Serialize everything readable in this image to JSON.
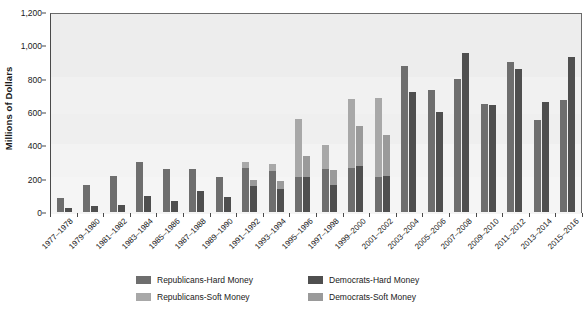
{
  "chart_data": {
    "type": "bar",
    "title": "",
    "subtitle": "",
    "xlabel": "",
    "ylabel": "Millions of Dollars",
    "ylim": [
      0,
      1200
    ],
    "ytick_values": [
      0,
      200,
      400,
      600,
      800,
      1000,
      1200
    ],
    "ytick_labels": [
      "0",
      "200",
      "400",
      "600",
      "800",
      "1,000",
      "1,200"
    ],
    "grid": false,
    "stacked": true,
    "legend_position": "below",
    "categories": [
      "1977–1978",
      "1979–1980",
      "1981–1982",
      "1983–1984",
      "1985–1986",
      "1987–1988",
      "1989–1990",
      "1991–1992",
      "1993–1994",
      "1995–1996",
      "1997–1998",
      "1999–2000",
      "2001–2002",
      "2003–2004",
      "2005–2006",
      "2007–2008",
      "2009–2010",
      "2011–2012",
      "2013–2014",
      "2015–2016"
    ],
    "series": [
      {
        "name": "Republicans-Hard Money",
        "color": "#6e6e6e",
        "values": [
          86,
          165,
          215,
          300,
          258,
          258,
          208,
          267,
          246,
          211,
          258,
          266,
          211,
          875,
          730,
          800,
          650,
          900,
          550,
          675
        ]
      },
      {
        "name": "Republicans-Soft Money",
        "color": "#a8a8a8",
        "values": [
          0,
          0,
          0,
          0,
          0,
          0,
          0,
          36,
          42,
          345,
          142,
          410,
          475,
          0,
          0,
          0,
          0,
          0,
          0,
          0
        ]
      },
      {
        "name": "Democrats-Hard Money",
        "color": "#4f4f4f",
        "values": [
          26,
          35,
          40,
          98,
          66,
          127,
          88,
          155,
          139,
          211,
          160,
          275,
          217,
          718,
          600,
          955,
          640,
          860,
          660,
          930
        ]
      },
      {
        "name": "Democrats-Soft Money",
        "color": "#9a9a9a",
        "values": [
          0,
          0,
          0,
          0,
          0,
          0,
          0,
          36,
          50,
          124,
          92,
          243,
          246,
          0,
          0,
          0,
          0,
          0,
          0,
          0
        ]
      }
    ],
    "legend": [
      {
        "label": "Republicans-Hard Money",
        "color": "#6e6e6e"
      },
      {
        "label": "Democrats-Hard Money",
        "color": "#4f4f4f"
      },
      {
        "label": "Republicans-Soft Money",
        "color": "#a8a8a8"
      },
      {
        "label": "Democrats-Soft Money",
        "color": "#9a9a9a"
      }
    ],
    "plot_background": "#f2f2f2",
    "axis_color": "#4a4a4a"
  }
}
